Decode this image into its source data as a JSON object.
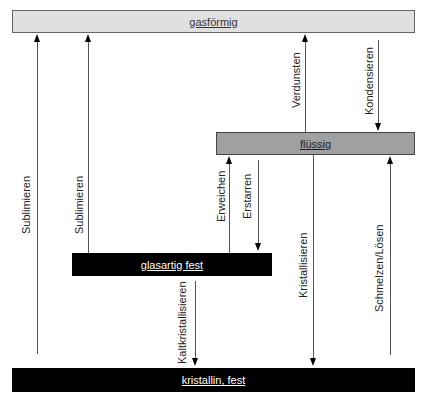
{
  "states": {
    "gas": {
      "label": "gasförmig",
      "color": "#e0e0e0"
    },
    "liquid": {
      "label": "flüssig",
      "color": "#a0a0a0"
    },
    "glass": {
      "label": "glasartig fest",
      "color": "#000000"
    },
    "crystal": {
      "label": "kristallin, fest",
      "color": "#000000"
    }
  },
  "transitions": [
    {
      "id": "sublimieren-1",
      "label": "Sublimieren",
      "from": "kristallin, fest",
      "to": "gasförmig",
      "direction": "up"
    },
    {
      "id": "sublimieren-2",
      "label": "Sublimieren",
      "from": "glasartig fest",
      "to": "gasförmig",
      "direction": "up"
    },
    {
      "id": "verdunsten",
      "label": "Verdunsten",
      "from": "flüssig",
      "to": "gasförmig",
      "direction": "up"
    },
    {
      "id": "kondensieren",
      "label": "Kondensieren",
      "from": "gasförmig",
      "to": "flüssig",
      "direction": "down"
    },
    {
      "id": "erweichen",
      "label": "Erweichen",
      "from": "glasartig fest",
      "to": "flüssig",
      "direction": "up"
    },
    {
      "id": "erstarren",
      "label": "Erstarren",
      "from": "flüssig",
      "to": "glasartig fest",
      "direction": "down"
    },
    {
      "id": "kaltkristallisieren",
      "label": "Kaltkristallisieren",
      "from": "glasartig fest",
      "to": "kristallin, fest",
      "direction": "down"
    },
    {
      "id": "kristallisieren",
      "label": "Kristallisieren",
      "from": "flüssig",
      "to": "kristallin, fest",
      "direction": "down"
    },
    {
      "id": "schmelzen-loesen",
      "label": "Schmelzen/Lösen",
      "from": "kristallin, fest",
      "to": "flüssig",
      "direction": "up"
    }
  ]
}
